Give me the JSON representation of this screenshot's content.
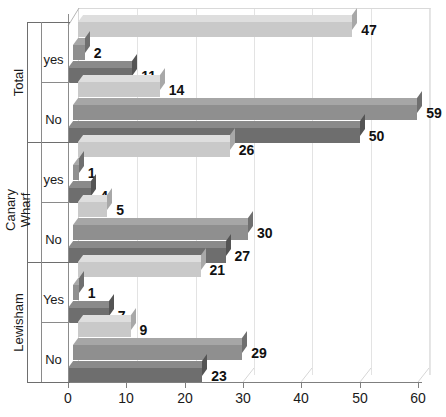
{
  "chart_data": {
    "type": "bar",
    "orientation": "horizontal",
    "title": "",
    "xlabel": "",
    "ylabel": "",
    "xlim": [
      0,
      60
    ],
    "xticks": [
      0,
      10,
      20,
      30,
      40,
      50,
      60
    ],
    "xtick_labels": [
      "0",
      "10",
      "20",
      "30",
      "40",
      "50",
      "60"
    ],
    "grid": true,
    "legend_position": "none",
    "group_axis_label_groups": [
      "Total",
      "Canary Wharf",
      "Lewisham"
    ],
    "categories": [
      "yes",
      "No",
      "yes",
      "No",
      "Yes",
      "No"
    ],
    "groups": [
      {
        "name": "Total",
        "categories": [
          {
            "label": "yes",
            "values": [
              47,
              2,
              11
            ]
          },
          {
            "label": "No",
            "values": [
              14,
              59,
              50
            ]
          }
        ]
      },
      {
        "name": "Canary Wharf",
        "categories": [
          {
            "label": "yes",
            "values": [
              26,
              1,
              4
            ]
          },
          {
            "label": "No",
            "values": [
              5,
              30,
              27
            ]
          }
        ]
      },
      {
        "name": "Lewisham",
        "categories": [
          {
            "label": "Yes",
            "values": [
              21,
              1,
              7
            ]
          },
          {
            "label": "No",
            "values": [
              9,
              29,
              23
            ]
          }
        ]
      }
    ],
    "series": [
      {
        "name": "Series 1",
        "color": "#c9c9c9",
        "values": [
          47,
          14,
          26,
          5,
          21,
          9
        ]
      },
      {
        "name": "Series 2",
        "color": "#8f8f8f",
        "values": [
          2,
          59,
          1,
          30,
          1,
          29
        ]
      },
      {
        "name": "Series 3",
        "color": "#6e6e6e",
        "values": [
          11,
          50,
          4,
          27,
          7,
          23
        ]
      }
    ],
    "data_labels": [
      "47",
      "2",
      "11",
      "14",
      "59",
      "50",
      "26",
      "1",
      "4",
      "5",
      "30",
      "27",
      "21",
      "1",
      "7",
      "9",
      "29",
      "23"
    ]
  },
  "colors": {
    "series1": "#c9c9c9",
    "series1_top": "#dedede",
    "series1_side": "#a8a8a8",
    "series2": "#8f8f8f",
    "series2_top": "#a6a6a6",
    "series2_side": "#6f6f6f",
    "series3": "#6e6e6e",
    "series3_top": "#8a8a8a",
    "series3_side": "#545454",
    "grid": "#e3e3e3",
    "axis": "#7f7f7f",
    "text": "#1a1a1a"
  },
  "axis": {
    "x_tick_labels": [
      "0",
      "10",
      "20",
      "30",
      "40",
      "50",
      "60"
    ]
  },
  "y_axis": {
    "groups": [
      {
        "name": "Total",
        "subs": [
          "yes",
          "No"
        ]
      },
      {
        "name": "Canary Wharf",
        "subs": [
          "yes",
          "No"
        ]
      },
      {
        "name": "Lewisham",
        "subs": [
          "Yes",
          "No"
        ]
      }
    ]
  }
}
